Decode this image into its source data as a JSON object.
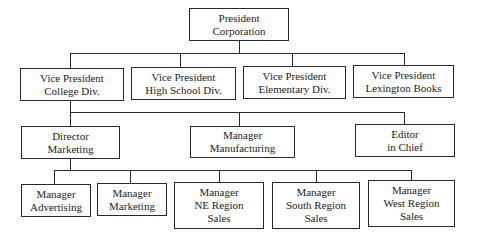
{
  "org_chart": {
    "root": {
      "id": "president",
      "lines": [
        "President",
        "Corporation"
      ]
    },
    "vice_presidents": [
      {
        "id": "vp-college",
        "lines": [
          "Vice President",
          "College Div."
        ]
      },
      {
        "id": "vp-high-school",
        "lines": [
          "Vice President",
          "High School Div."
        ]
      },
      {
        "id": "vp-elementary",
        "lines": [
          "Vice President",
          "Elementary Div."
        ]
      },
      {
        "id": "vp-lexington",
        "lines": [
          "Vice President",
          "Lexington Books"
        ]
      }
    ],
    "college_division_reports": [
      {
        "id": "director-marketing",
        "lines": [
          "Director",
          "Marketing"
        ]
      },
      {
        "id": "manager-manufacturing",
        "lines": [
          "Manager",
          "Manufacturing"
        ]
      },
      {
        "id": "editor-in-chief",
        "lines": [
          "Editor",
          "in Chief"
        ]
      }
    ],
    "marketing_reports": [
      {
        "id": "manager-advertising",
        "lines": [
          "Manager",
          "Advertising"
        ]
      },
      {
        "id": "manager-marketing",
        "lines": [
          "Manager",
          "Marketing"
        ]
      },
      {
        "id": "manager-ne-region-sales",
        "lines": [
          "Manager",
          "NE Region",
          "Sales"
        ]
      },
      {
        "id": "manager-south-region-sales",
        "lines": [
          "Manager",
          "South Region",
          "Sales"
        ]
      },
      {
        "id": "manager-west-region-sales",
        "lines": [
          "Manager",
          "West Region",
          "Sales"
        ]
      }
    ]
  }
}
